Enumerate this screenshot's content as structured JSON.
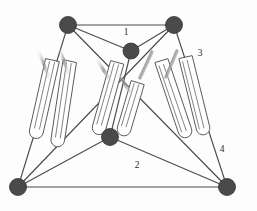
{
  "figure": {
    "background_color": "#fdfdfd",
    "node_color": "#4a4a4a",
    "edge_color": "#4c4c4c",
    "tube_color": "#5a5a5a",
    "label_color": "#2b2b2b",
    "sheen_color": "#bcbcbc"
  },
  "nodes": [
    {
      "id": "top-left",
      "name": "node-top-left",
      "x": 68,
      "y": 25,
      "r": 8.5
    },
    {
      "id": "top-right",
      "name": "node-top-right",
      "x": 174,
      "y": 25,
      "r": 8.5
    },
    {
      "id": "upper-center",
      "name": "node-upper-center",
      "x": 131,
      "y": 51,
      "r": 8.0
    },
    {
      "id": "middle-center",
      "name": "node-middle-center",
      "x": 110,
      "y": 137,
      "r": 8.5
    },
    {
      "id": "bottom-left",
      "name": "node-bottom-left",
      "x": 18,
      "y": 187,
      "r": 8.5
    },
    {
      "id": "bottom-right",
      "name": "node-bottom-right",
      "x": 227,
      "y": 187,
      "r": 8.5
    }
  ],
  "edges": [
    {
      "name": "edge-top",
      "from": "top-left",
      "to": "top-right",
      "x1": 68,
      "y1": 25,
      "x2": 174,
      "y2": 25
    },
    {
      "name": "edge-bottom",
      "from": "bottom-left",
      "to": "bottom-right",
      "x1": 18,
      "y1": 187,
      "x2": 227,
      "y2": 187
    },
    {
      "name": "edge-topleft-center",
      "from": "top-left",
      "to": "upper-center",
      "x1": 68,
      "y1": 25,
      "x2": 131,
      "y2": 51
    },
    {
      "name": "edge-topright-center",
      "from": "top-right",
      "to": "upper-center",
      "x1": 174,
      "y1": 25,
      "x2": 131,
      "y2": 51
    },
    {
      "name": "edge-topleft-bottomright",
      "from": "top-left",
      "to": "bottom-right",
      "x1": 68,
      "y1": 25,
      "x2": 227,
      "y2": 187
    },
    {
      "name": "edge-topright-bottomleft",
      "from": "top-right",
      "to": "bottom-left",
      "x1": 174,
      "y1": 25,
      "x2": 18,
      "y2": 187
    },
    {
      "name": "edge-topleft-bottomleft",
      "from": "top-left",
      "to": "bottom-left",
      "x1": 68,
      "y1": 25,
      "x2": 18,
      "y2": 187
    },
    {
      "name": "edge-topright-bottomright",
      "from": "top-right",
      "to": "bottom-right",
      "x1": 174,
      "y1": 25,
      "x2": 227,
      "y2": 187
    },
    {
      "name": "edge-center-middle",
      "from": "upper-center",
      "to": "middle-center",
      "x1": 131,
      "y1": 51,
      "x2": 110,
      "y2": 137
    },
    {
      "name": "edge-middle-bottomleft",
      "from": "middle-center",
      "to": "bottom-left",
      "x1": 110,
      "y1": 137,
      "x2": 18,
      "y2": 187
    },
    {
      "name": "edge-middle-bottomright",
      "from": "middle-center",
      "to": "bottom-right",
      "x1": 110,
      "y1": 137,
      "x2": 227,
      "y2": 187
    }
  ],
  "labels": [
    {
      "name": "edge-label-1",
      "text": "1",
      "x": 126,
      "y": 33
    },
    {
      "name": "edge-label-2",
      "text": "2",
      "x": 137,
      "y": 166
    },
    {
      "name": "edge-label-3",
      "text": "3",
      "x": 200,
      "y": 54
    },
    {
      "name": "edge-label-4",
      "text": "4",
      "x": 222,
      "y": 150
    }
  ],
  "actuators": [
    {
      "name": "actuator-left-outer",
      "x1": 49,
      "y1": 60,
      "x2": 33,
      "y2": 131,
      "width": 7.0
    },
    {
      "name": "actuator-left-inner",
      "x1": 66,
      "y1": 61,
      "x2": 54,
      "y2": 140,
      "width": 7.0
    },
    {
      "name": "actuator-center-left",
      "x1": 114,
      "y1": 62,
      "x2": 96,
      "y2": 127,
      "width": 7.0
    },
    {
      "name": "actuator-center-right",
      "x1": 134,
      "y1": 82,
      "x2": 121,
      "y2": 128,
      "width": 7.0
    },
    {
      "name": "actuator-right-inner",
      "x1": 158,
      "y1": 64,
      "x2": 182,
      "y2": 134,
      "width": 7.0
    },
    {
      "name": "actuator-right-outer",
      "x1": 182,
      "y1": 60,
      "x2": 200,
      "y2": 131,
      "width": 7.0
    }
  ],
  "sheens": [
    {
      "name": "sheen-left-a",
      "x1": 39,
      "y1": 52,
      "x2": 49,
      "y2": 79
    },
    {
      "name": "sheen-left-b",
      "x1": 60,
      "y1": 51,
      "x2": 68,
      "y2": 74
    },
    {
      "name": "sheen-center-a",
      "x1": 98,
      "y1": 60,
      "x2": 112,
      "y2": 82
    },
    {
      "name": "sheen-center-b",
      "x1": 119,
      "y1": 75,
      "x2": 132,
      "y2": 95
    },
    {
      "name": "sheen-right-a",
      "x1": 150,
      "y1": 53,
      "x2": 141,
      "y2": 77
    },
    {
      "name": "sheen-right-b",
      "x1": 176,
      "y1": 52,
      "x2": 168,
      "y2": 76
    }
  ]
}
